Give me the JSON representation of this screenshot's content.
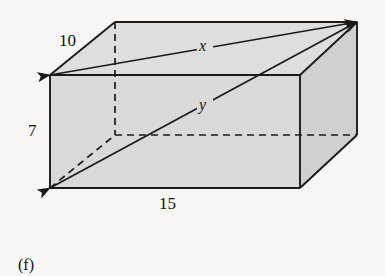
{
  "figure": {
    "caption": "(f)",
    "shape_name": "rectangular-box",
    "labels": {
      "depth": "10",
      "height": "7",
      "width": "15",
      "top_diagonal": "x",
      "space_diagonal": "y"
    },
    "colors": {
      "background": "#f7f6f4",
      "face_fill": "#d9d9d9",
      "top_face_fill": "#dedede",
      "side_face_fill": "#d2d2d2",
      "stroke": "#1a1a1a"
    },
    "geometry": {
      "top_back_left": [
        115,
        22
      ],
      "top_back_right": [
        357,
        22
      ],
      "top_front_left": [
        50,
        75
      ],
      "top_front_right": [
        300,
        75
      ],
      "bottom_front_left": [
        50,
        188
      ],
      "bottom_front_right": [
        300,
        188
      ],
      "bottom_back_right": [
        357,
        135
      ],
      "bottom_back_left_hidden": [
        115,
        135
      ]
    },
    "arrows": [
      {
        "name": "x-diagonal",
        "from": [
          50,
          75
        ],
        "to": [
          357,
          22
        ],
        "double_headed": true
      },
      {
        "name": "y-diagonal",
        "from": [
          50,
          188
        ],
        "to": [
          357,
          22
        ],
        "double_headed": true
      }
    ]
  }
}
